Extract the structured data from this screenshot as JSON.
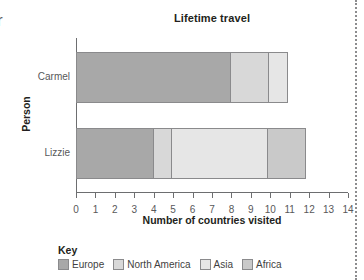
{
  "edge_fragment": "r",
  "chart_data": {
    "type": "bar",
    "orientation": "horizontal",
    "stacked": true,
    "title": "Lifetime travel",
    "xlabel": "Number of countries visited",
    "ylabel": "Person",
    "xlim": [
      0,
      14
    ],
    "xticks": [
      "0",
      "1",
      "2",
      "3",
      "4",
      "5",
      "6",
      "7",
      "8",
      "9",
      "10",
      "11",
      "12",
      "13",
      "14"
    ],
    "grid": false,
    "legend_title": "Key",
    "legend_position": "bottom",
    "categories": [
      "Carmel",
      "Lizzie"
    ],
    "series": [
      {
        "name": "Europe",
        "color": "#a8a8a8",
        "values": [
          8,
          4
        ]
      },
      {
        "name": "North America",
        "color": "#d8d8d8",
        "values": [
          2,
          1
        ]
      },
      {
        "name": "Asia",
        "color": "#e6e6e6",
        "values": [
          1,
          5
        ]
      },
      {
        "name": "Africa",
        "color": "#c9c9c9",
        "values": [
          0,
          2
        ]
      }
    ],
    "totals": [
      11,
      12
    ]
  }
}
